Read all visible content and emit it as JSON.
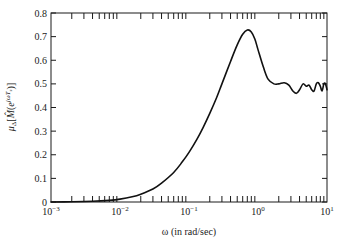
{
  "chart_data": {
    "type": "line",
    "title": "",
    "xlabel": "ω (in rad/sec)",
    "ylabel": "μΔ[M̂(e^{jωT_s})]",
    "xscale": "log",
    "xlim": [
      0.001,
      10
    ],
    "ylim": [
      0,
      0.8
    ],
    "grid": false,
    "legend": null,
    "x_tick_labels": [
      {
        "base": "10",
        "exp": "−3",
        "value": 0.001
      },
      {
        "base": "10",
        "exp": "−2",
        "value": 0.01
      },
      {
        "base": "10",
        "exp": "−1",
        "value": 0.1
      },
      {
        "base": "10",
        "exp": "0",
        "value": 1
      },
      {
        "base": "10",
        "exp": "1",
        "value": 10
      }
    ],
    "y_tick_labels": [
      "0",
      "0.1",
      "0.2",
      "0.3",
      "0.4",
      "0.5",
      "0.6",
      "0.7",
      "0.8"
    ],
    "series": [
      {
        "name": "mu",
        "color": "#111111",
        "x": [
          0.001,
          0.002,
          0.004,
          0.007,
          0.01,
          0.015,
          0.02,
          0.03,
          0.04,
          0.06,
          0.08,
          0.1,
          0.13,
          0.16,
          0.2,
          0.25,
          0.3,
          0.4,
          0.5,
          0.6,
          0.7,
          0.8,
          0.9,
          1.0,
          1.2,
          1.4,
          1.7,
          2.0,
          2.4,
          2.8,
          3.2,
          3.6,
          4.0,
          4.5,
          5.0,
          5.5,
          6.0,
          6.5,
          7.0,
          7.5,
          8.0,
          8.5,
          9.0,
          9.5,
          10.0
        ],
        "y": [
          0.0,
          0.001,
          0.003,
          0.007,
          0.012,
          0.022,
          0.033,
          0.055,
          0.08,
          0.125,
          0.17,
          0.21,
          0.265,
          0.315,
          0.375,
          0.44,
          0.5,
          0.595,
          0.665,
          0.71,
          0.728,
          0.72,
          0.69,
          0.645,
          0.57,
          0.52,
          0.5,
          0.5,
          0.505,
          0.495,
          0.47,
          0.46,
          0.475,
          0.5,
          0.49,
          0.495,
          0.475,
          0.47,
          0.5,
          0.505,
          0.49,
          0.47,
          0.5,
          0.5,
          0.475
        ]
      }
    ]
  }
}
